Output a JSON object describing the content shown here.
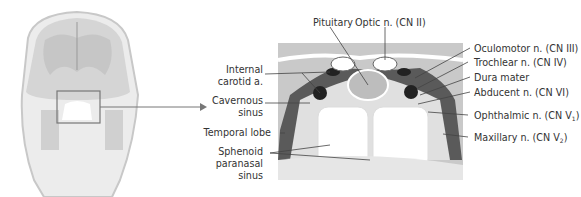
{
  "figure": {
    "overview": {
      "description": "Coronal head section",
      "highlight_box": "sella region"
    },
    "labels_left": [
      {
        "id": "internal-carotid",
        "line1": "Internal",
        "line2": "carotid a."
      },
      {
        "id": "cavernous-sinus",
        "line1": "Cavernous",
        "line2": "sinus"
      },
      {
        "id": "temporal-lobe",
        "line1": "Temporal lobe"
      },
      {
        "id": "sphenoid-sinus",
        "line1": "Sphenoid",
        "line2": "paranasal",
        "line3": "sinus"
      }
    ],
    "labels_top": [
      {
        "id": "pituitary",
        "text": "Pituitary"
      },
      {
        "id": "optic",
        "text": "Optic n. (CN II)"
      }
    ],
    "labels_right": [
      {
        "id": "oculomotor",
        "text": "Oculomotor n. (CN III)"
      },
      {
        "id": "trochlear",
        "text": "Trochlear n. (CN IV)"
      },
      {
        "id": "dura",
        "text": "Dura mater"
      },
      {
        "id": "abducent",
        "text": "Abducent n. (CN VI)"
      },
      {
        "id": "ophthalmic",
        "text": "Ophthalmic n. (CN V",
        "sub": "1",
        "close": ")"
      },
      {
        "id": "maxillary",
        "text": "Maxillary n. (CN V",
        "sub": "2",
        "close": ")"
      }
    ]
  },
  "colors": {
    "brain": "#c9c9c9",
    "bone": "#e3e3e3",
    "dark": "#2a2a2a",
    "line": "#444444"
  }
}
